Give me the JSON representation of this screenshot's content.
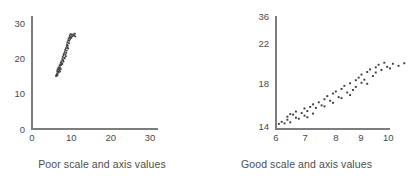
{
  "figure": {
    "panels": [
      {
        "id": "poor-scale",
        "caption": "Poor scale and axis values"
      },
      {
        "id": "good-scale",
        "caption": "Good scale and axis values"
      }
    ]
  },
  "chart_data": [
    {
      "type": "scatter",
      "title": "Poor scale and axis values",
      "xlabel": "",
      "ylabel": "",
      "xlim": [
        0,
        32
      ],
      "ylim": [
        0,
        32
      ],
      "xticks": [
        0,
        10,
        20,
        30
      ],
      "yticks": [
        0,
        10,
        20,
        30
      ],
      "xticklabels": [
        "0",
        "10",
        "20",
        "30"
      ],
      "yticklabels": [
        "0",
        "10",
        "20",
        "30"
      ],
      "grid": false,
      "legend": null,
      "marker_color": "#3b3b3b",
      "axis_color": "#7d7d7d",
      "note": "Same data as right panel but plotted on a 0-30 range, compressing all points into a small cluster in the lower-left corner.",
      "points": [
        [
          6.1,
          15.0
        ],
        [
          6.2,
          15.4
        ],
        [
          6.3,
          15.1
        ],
        [
          6.4,
          15.8
        ],
        [
          6.4,
          16.4
        ],
        [
          6.5,
          15.3
        ],
        [
          6.6,
          16.8
        ],
        [
          6.7,
          16.2
        ],
        [
          6.7,
          17.4
        ],
        [
          6.8,
          16.0
        ],
        [
          6.9,
          17.1
        ],
        [
          7.0,
          16.6
        ],
        [
          7.0,
          18.0
        ],
        [
          7.1,
          17.5
        ],
        [
          7.2,
          18.3
        ],
        [
          7.3,
          17.0
        ],
        [
          7.3,
          18.8
        ],
        [
          7.4,
          18.1
        ],
        [
          7.5,
          19.2
        ],
        [
          7.6,
          18.6
        ],
        [
          7.7,
          19.8
        ],
        [
          7.7,
          18.4
        ],
        [
          7.8,
          20.4
        ],
        [
          7.9,
          19.5
        ],
        [
          8.0,
          20.9
        ],
        [
          8.0,
          19.1
        ],
        [
          8.1,
          21.3
        ],
        [
          8.2,
          20.2
        ],
        [
          8.3,
          21.8
        ],
        [
          8.3,
          20.0
        ],
        [
          8.4,
          22.4
        ],
        [
          8.5,
          21.1
        ],
        [
          8.6,
          22.9
        ],
        [
          8.7,
          21.6
        ],
        [
          8.8,
          23.5
        ],
        [
          8.8,
          22.2
        ],
        [
          8.9,
          24.0
        ],
        [
          9.0,
          23.0
        ],
        [
          9.0,
          24.6
        ],
        [
          9.1,
          23.6
        ],
        [
          9.2,
          25.1
        ],
        [
          9.2,
          22.8
        ],
        [
          9.3,
          25.6
        ],
        [
          9.4,
          24.3
        ],
        [
          9.5,
          26.0
        ],
        [
          9.5,
          25.0
        ],
        [
          9.6,
          26.5
        ],
        [
          9.7,
          25.5
        ],
        [
          9.8,
          26.9
        ],
        [
          9.9,
          26.1
        ],
        [
          10.0,
          25.8
        ],
        [
          10.1,
          26.7
        ],
        [
          10.3,
          26.3
        ],
        [
          10.5,
          26.8
        ],
        [
          10.7,
          26.5
        ],
        [
          10.9,
          27.0
        ],
        [
          11.0,
          26.2
        ],
        [
          6.5,
          16.9
        ],
        [
          7.1,
          16.3
        ],
        [
          8.6,
          20.6
        ]
      ]
    },
    {
      "type": "scatter",
      "title": "Good scale and axis values",
      "xlabel": "",
      "ylabel": "",
      "xlim": [
        6,
        10
      ],
      "ylim": [
        14,
        36
      ],
      "xticks": [
        6,
        7,
        8,
        9,
        10
      ],
      "yticks": [
        14,
        18,
        22,
        36
      ],
      "xticklabels": [
        "6",
        "7",
        "8",
        "9",
        "10"
      ],
      "yticklabels": [
        "14",
        "18",
        "22",
        "36"
      ],
      "grid": false,
      "legend": null,
      "marker_color": "#3b3b3b",
      "axis_color": "#7d7d7d",
      "note": "Same data plotted on a fitted range so the positive linear trend fills the plotting area.",
      "points": [
        [
          6.1,
          15.0
        ],
        [
          6.2,
          15.4
        ],
        [
          6.3,
          15.1
        ],
        [
          6.4,
          15.8
        ],
        [
          6.4,
          16.4
        ],
        [
          6.5,
          15.3
        ],
        [
          6.6,
          16.8
        ],
        [
          6.7,
          16.2
        ],
        [
          6.7,
          17.4
        ],
        [
          6.8,
          16.0
        ],
        [
          6.9,
          17.1
        ],
        [
          7.0,
          16.6
        ],
        [
          7.0,
          18.0
        ],
        [
          7.1,
          17.5
        ],
        [
          7.2,
          18.3
        ],
        [
          7.3,
          17.0
        ],
        [
          7.3,
          18.8
        ],
        [
          7.4,
          18.1
        ],
        [
          7.5,
          19.2
        ],
        [
          7.6,
          18.6
        ],
        [
          7.7,
          19.8
        ],
        [
          7.7,
          18.4
        ],
        [
          7.8,
          20.4
        ],
        [
          7.9,
          19.5
        ],
        [
          8.0,
          20.9
        ],
        [
          8.0,
          19.1
        ],
        [
          8.1,
          21.3
        ],
        [
          8.2,
          20.2
        ],
        [
          8.3,
          21.8
        ],
        [
          8.3,
          20.0
        ],
        [
          8.4,
          22.4
        ],
        [
          8.5,
          21.1
        ],
        [
          8.6,
          22.9
        ],
        [
          8.7,
          21.6
        ],
        [
          8.8,
          23.5
        ],
        [
          8.8,
          22.2
        ],
        [
          8.9,
          24.0
        ],
        [
          9.0,
          23.0
        ],
        [
          9.0,
          24.6
        ],
        [
          9.1,
          23.6
        ],
        [
          9.2,
          25.1
        ],
        [
          9.2,
          22.8
        ],
        [
          9.3,
          25.6
        ],
        [
          9.4,
          24.3
        ],
        [
          9.5,
          26.0
        ],
        [
          9.5,
          25.0
        ],
        [
          9.6,
          26.5
        ],
        [
          9.7,
          25.5
        ],
        [
          9.8,
          26.9
        ],
        [
          9.9,
          26.1
        ],
        [
          10.0,
          25.8
        ],
        [
          10.1,
          26.7
        ],
        [
          10.3,
          26.3
        ],
        [
          10.5,
          26.8
        ],
        [
          10.7,
          26.5
        ],
        [
          10.9,
          27.0
        ],
        [
          11.0,
          26.2
        ],
        [
          6.5,
          16.9
        ],
        [
          7.1,
          16.3
        ],
        [
          8.6,
          20.6
        ]
      ]
    }
  ]
}
